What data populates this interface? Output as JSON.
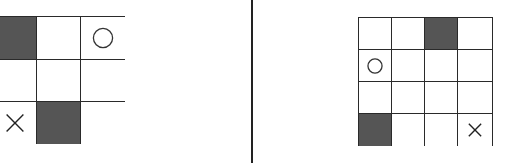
{
  "panels": [
    {
      "id": "left",
      "rows": 3,
      "cols": 3,
      "cells": [
        [
          "dark",
          "empty",
          "circle"
        ],
        [
          "empty",
          "empty",
          "empty"
        ],
        [
          "cross",
          "dark",
          "empty"
        ]
      ]
    },
    {
      "id": "right",
      "rows": 4,
      "cols": 4,
      "cells": [
        [
          "empty",
          "empty",
          "dark",
          "empty"
        ],
        [
          "circle",
          "empty",
          "empty",
          "empty"
        ],
        [
          "empty",
          "empty",
          "empty",
          "empty"
        ],
        [
          "dark",
          "empty",
          "empty",
          "cross"
        ]
      ]
    }
  ],
  "colors": {
    "dark_cell": "#555555",
    "grid_line": "#2a2a2a",
    "divider": "#222222",
    "background": "#ffffff"
  },
  "icons": {
    "circle": "circle-icon",
    "cross": "cross-icon"
  }
}
